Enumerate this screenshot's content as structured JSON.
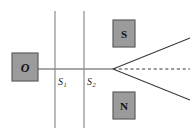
{
  "figure": {
    "type": "stern-gerlach-beam-splitting-diagram",
    "background_color": "#ffffff",
    "width": 194,
    "height": 133
  },
  "colors": {
    "box_fill": "#9b9b9b",
    "box_stroke": "#5e5e5e",
    "line": "#808080",
    "beam": "#3a3a3a",
    "slit_line": "#8c8c8c",
    "label_text": "#111111"
  },
  "source": {
    "label": "O",
    "x": 12,
    "y": 53,
    "width": 26,
    "height": 28
  },
  "slits": [
    {
      "name": "slit-1",
      "label": "S",
      "subscript": "1",
      "line_x": 55,
      "line_y_top": 11,
      "line_y_bottom": 128,
      "label_x": 58,
      "label_y": 85
    },
    {
      "name": "slit-2",
      "label": "S",
      "subscript": "2",
      "line_x": 84,
      "line_y_top": 11,
      "line_y_bottom": 128,
      "label_x": 87,
      "label_y": 85
    }
  ],
  "magnets": [
    {
      "name": "magnet-south-pole",
      "label": "S",
      "x": 113,
      "y": 20,
      "width": 22,
      "height": 27
    },
    {
      "name": "magnet-north-pole",
      "label": "N",
      "x": 113,
      "y": 92,
      "width": 22,
      "height": 27
    }
  ],
  "beams": {
    "incident": {
      "name": "incident-beam",
      "x1": 38,
      "y1": 69,
      "x2": 113,
      "y2": 69,
      "style": "solid"
    },
    "split_vertex": {
      "x": 113,
      "y": 69
    },
    "upper": {
      "name": "upper-deflected-beam",
      "x1": 113,
      "y1": 69,
      "x2": 190,
      "y2": 38,
      "style": "solid"
    },
    "center": {
      "name": "center-undeflected-beam",
      "x1": 113,
      "y1": 69,
      "x2": 190,
      "y2": 69,
      "style": "dashed"
    },
    "lower": {
      "name": "lower-deflected-beam",
      "x1": 113,
      "y1": 69,
      "x2": 190,
      "y2": 100,
      "style": "solid"
    }
  }
}
